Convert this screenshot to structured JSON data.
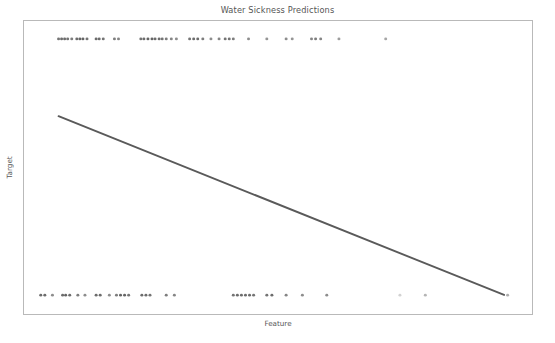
{
  "chart_data": {
    "type": "scatter",
    "title": "Water Sickness Predictions",
    "xlabel": "Feature",
    "ylabel": "Target",
    "grid": false,
    "legend": null,
    "xlim": [
      0,
      1
    ],
    "ylim": [
      0,
      1
    ],
    "xticks": [],
    "yticks": [],
    "xticklabels": [],
    "yticklabels": [],
    "marker_color": "#5c5c5c",
    "line_color": "#5a5a5a",
    "frame_color": "#b9b9b9",
    "background_color": "#ffffff",
    "series": [
      {
        "name": "Observations",
        "type": "scatter",
        "marker": "circle",
        "points": [
          {
            "x": 0.068,
            "y": 1,
            "alpha": 0.85
          },
          {
            "x": 0.074,
            "y": 1,
            "alpha": 0.9
          },
          {
            "x": 0.08,
            "y": 1,
            "alpha": 0.9
          },
          {
            "x": 0.086,
            "y": 1,
            "alpha": 0.85
          },
          {
            "x": 0.094,
            "y": 1,
            "alpha": 0.8
          },
          {
            "x": 0.104,
            "y": 1,
            "alpha": 0.9
          },
          {
            "x": 0.11,
            "y": 1,
            "alpha": 0.95
          },
          {
            "x": 0.116,
            "y": 1,
            "alpha": 0.95
          },
          {
            "x": 0.124,
            "y": 1,
            "alpha": 0.85
          },
          {
            "x": 0.142,
            "y": 1,
            "alpha": 0.9
          },
          {
            "x": 0.148,
            "y": 1,
            "alpha": 0.9
          },
          {
            "x": 0.156,
            "y": 1,
            "alpha": 0.85
          },
          {
            "x": 0.178,
            "y": 1,
            "alpha": 0.8
          },
          {
            "x": 0.186,
            "y": 1,
            "alpha": 0.75
          },
          {
            "x": 0.23,
            "y": 1,
            "alpha": 0.85
          },
          {
            "x": 0.236,
            "y": 1,
            "alpha": 0.9
          },
          {
            "x": 0.244,
            "y": 1,
            "alpha": 0.95
          },
          {
            "x": 0.252,
            "y": 1,
            "alpha": 0.95
          },
          {
            "x": 0.258,
            "y": 1,
            "alpha": 0.9
          },
          {
            "x": 0.266,
            "y": 1,
            "alpha": 0.9
          },
          {
            "x": 0.272,
            "y": 1,
            "alpha": 0.85
          },
          {
            "x": 0.28,
            "y": 1,
            "alpha": 0.8
          },
          {
            "x": 0.29,
            "y": 1,
            "alpha": 0.75
          },
          {
            "x": 0.3,
            "y": 1,
            "alpha": 0.7
          },
          {
            "x": 0.326,
            "y": 1,
            "alpha": 0.85
          },
          {
            "x": 0.334,
            "y": 1,
            "alpha": 0.9
          },
          {
            "x": 0.342,
            "y": 1,
            "alpha": 0.9
          },
          {
            "x": 0.352,
            "y": 1,
            "alpha": 0.8
          },
          {
            "x": 0.368,
            "y": 1,
            "alpha": 0.7
          },
          {
            "x": 0.384,
            "y": 1,
            "alpha": 0.75
          },
          {
            "x": 0.396,
            "y": 1,
            "alpha": 0.85
          },
          {
            "x": 0.404,
            "y": 1,
            "alpha": 0.85
          },
          {
            "x": 0.412,
            "y": 1,
            "alpha": 0.8
          },
          {
            "x": 0.442,
            "y": 1,
            "alpha": 0.7
          },
          {
            "x": 0.478,
            "y": 1,
            "alpha": 0.65
          },
          {
            "x": 0.516,
            "y": 1,
            "alpha": 0.7
          },
          {
            "x": 0.528,
            "y": 1,
            "alpha": 0.65
          },
          {
            "x": 0.566,
            "y": 1,
            "alpha": 0.75
          },
          {
            "x": 0.574,
            "y": 1,
            "alpha": 0.8
          },
          {
            "x": 0.584,
            "y": 1,
            "alpha": 0.75
          },
          {
            "x": 0.62,
            "y": 1,
            "alpha": 0.6
          },
          {
            "x": 0.712,
            "y": 1,
            "alpha": 0.55
          },
          {
            "x": 0.033,
            "y": 0,
            "alpha": 0.9
          },
          {
            "x": 0.041,
            "y": 0,
            "alpha": 0.9
          },
          {
            "x": 0.056,
            "y": 0,
            "alpha": 0.7
          },
          {
            "x": 0.076,
            "y": 0,
            "alpha": 0.9
          },
          {
            "x": 0.082,
            "y": 0,
            "alpha": 0.95
          },
          {
            "x": 0.09,
            "y": 0,
            "alpha": 0.9
          },
          {
            "x": 0.106,
            "y": 0,
            "alpha": 0.8
          },
          {
            "x": 0.12,
            "y": 0,
            "alpha": 0.7
          },
          {
            "x": 0.142,
            "y": 0,
            "alpha": 0.9
          },
          {
            "x": 0.15,
            "y": 0,
            "alpha": 0.9
          },
          {
            "x": 0.168,
            "y": 0,
            "alpha": 0.7
          },
          {
            "x": 0.182,
            "y": 0,
            "alpha": 0.8
          },
          {
            "x": 0.19,
            "y": 0,
            "alpha": 0.95
          },
          {
            "x": 0.198,
            "y": 0,
            "alpha": 0.95
          },
          {
            "x": 0.206,
            "y": 0,
            "alpha": 0.85
          },
          {
            "x": 0.232,
            "y": 0,
            "alpha": 0.9
          },
          {
            "x": 0.24,
            "y": 0,
            "alpha": 0.9
          },
          {
            "x": 0.248,
            "y": 0,
            "alpha": 0.85
          },
          {
            "x": 0.28,
            "y": 0,
            "alpha": 0.8
          },
          {
            "x": 0.296,
            "y": 0,
            "alpha": 0.75
          },
          {
            "x": 0.412,
            "y": 0,
            "alpha": 0.85
          },
          {
            "x": 0.42,
            "y": 0,
            "alpha": 0.9
          },
          {
            "x": 0.428,
            "y": 0,
            "alpha": 0.9
          },
          {
            "x": 0.436,
            "y": 0,
            "alpha": 0.9
          },
          {
            "x": 0.444,
            "y": 0,
            "alpha": 0.9
          },
          {
            "x": 0.452,
            "y": 0,
            "alpha": 0.85
          },
          {
            "x": 0.478,
            "y": 0,
            "alpha": 0.85
          },
          {
            "x": 0.488,
            "y": 0,
            "alpha": 0.9
          },
          {
            "x": 0.516,
            "y": 0,
            "alpha": 0.75
          },
          {
            "x": 0.548,
            "y": 0,
            "alpha": 0.7
          },
          {
            "x": 0.596,
            "y": 0,
            "alpha": 0.7
          },
          {
            "x": 0.74,
            "y": 0,
            "alpha": 0.28
          },
          {
            "x": 0.79,
            "y": 0,
            "alpha": 0.45
          },
          {
            "x": 0.952,
            "y": 0,
            "alpha": 0.5
          }
        ]
      },
      {
        "name": "Prediction",
        "type": "line",
        "x": [
          0.068,
          0.945
        ],
        "y": [
          0.675,
          0.065
        ]
      }
    ]
  },
  "figure": {
    "title": "Water Sickness Predictions",
    "xlabel": "Feature",
    "ylabel": "Target"
  }
}
